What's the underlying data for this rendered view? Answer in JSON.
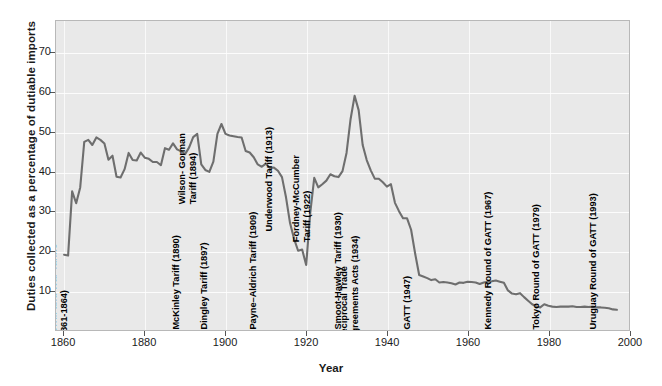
{
  "chart_data": {
    "type": "line",
    "title": "",
    "xlabel": "Year",
    "ylabel": "Duties collected as a percentage of dutiable imports",
    "xlim": [
      1858,
      2000
    ],
    "ylim": [
      0,
      78
    ],
    "xticks": [
      1860,
      1880,
      1900,
      1920,
      1940,
      1960,
      1980,
      2000
    ],
    "yticks": [
      10,
      20,
      30,
      40,
      50,
      60,
      70
    ],
    "grid": true,
    "legend": "none",
    "line_color": "#6e6e6e",
    "plot_background": "#e9e9e9",
    "series": [
      {
        "name": "Duties collected as a percentage of dutiable imports",
        "x": [
          1860,
          1861,
          1862,
          1863,
          1864,
          1865,
          1866,
          1867,
          1868,
          1869,
          1870,
          1871,
          1872,
          1873,
          1874,
          1875,
          1876,
          1877,
          1878,
          1879,
          1880,
          1881,
          1882,
          1883,
          1884,
          1885,
          1886,
          1887,
          1888,
          1889,
          1890,
          1891,
          1892,
          1893,
          1894,
          1895,
          1896,
          1897,
          1898,
          1899,
          1900,
          1901,
          1902,
          1903,
          1904,
          1905,
          1906,
          1907,
          1908,
          1909,
          1910,
          1911,
          1912,
          1913,
          1914,
          1915,
          1916,
          1917,
          1918,
          1919,
          1920,
          1921,
          1922,
          1923,
          1924,
          1925,
          1926,
          1927,
          1928,
          1929,
          1930,
          1931,
          1932,
          1933,
          1934,
          1935,
          1936,
          1937,
          1938,
          1939,
          1940,
          1941,
          1942,
          1943,
          1944,
          1945,
          1946,
          1947,
          1948,
          1949,
          1950,
          1951,
          1952,
          1953,
          1954,
          1955,
          1956,
          1957,
          1958,
          1959,
          1960,
          1961,
          1962,
          1963,
          1964,
          1965,
          1966,
          1967,
          1968,
          1969,
          1970,
          1971,
          1972,
          1973,
          1974,
          1975,
          1976,
          1977,
          1978,
          1979,
          1980,
          1981,
          1982,
          1983,
          1984,
          1985,
          1986,
          1987,
          1988,
          1989,
          1990,
          1991,
          1992,
          1993,
          1994,
          1995,
          1996,
          1997
        ],
        "y": [
          19.0,
          18.8,
          35.0,
          32.0,
          36.0,
          47.5,
          48.0,
          46.7,
          48.6,
          48.0,
          47.1,
          43.0,
          44.0,
          38.7,
          38.5,
          40.6,
          44.7,
          42.9,
          42.8,
          44.8,
          43.5,
          43.2,
          42.4,
          42.4,
          41.6,
          45.9,
          45.5,
          47.1,
          45.6,
          45.1,
          44.4,
          46.1,
          48.7,
          49.5,
          41.8,
          40.4,
          39.9,
          42.5,
          49.5,
          52.0,
          49.5,
          49.1,
          48.9,
          48.7,
          48.6,
          45.2,
          44.8,
          43.6,
          41.8,
          41.2,
          42.0,
          40.9,
          41.0,
          40.2,
          38.6,
          33.5,
          27.0,
          23.0,
          20.0,
          20.3,
          16.4,
          29.5,
          38.4,
          36.0,
          36.8,
          37.7,
          39.3,
          38.8,
          38.6,
          40.1,
          44.7,
          53.2,
          59.1,
          55.5,
          46.7,
          42.9,
          40.3,
          38.2,
          38.2,
          37.3,
          36.2,
          36.8,
          32.1,
          30.0,
          28.2,
          28.2,
          25.3,
          19.3,
          13.9,
          13.5,
          13.1,
          12.6,
          12.8,
          12.0,
          12.1,
          12.0,
          11.8,
          11.5,
          12.0,
          11.9,
          12.2,
          12.1,
          12.0,
          11.6,
          12.0,
          12.2,
          12.3,
          12.5,
          12.2,
          11.9,
          10.0,
          9.2,
          9.0,
          9.3,
          8.3,
          7.4,
          6.5,
          6.0,
          5.7,
          6.5,
          6.1,
          5.9,
          5.8,
          5.9,
          5.9,
          5.9,
          6.0,
          5.8,
          5.8,
          5.9,
          5.8,
          5.9,
          5.7,
          5.7,
          5.6,
          5.5,
          5.2,
          5.1
        ]
      }
    ],
    "annotations": [
      {
        "text": "Morrill and War Tariffs\n(1861-1864)",
        "year": 1862,
        "lines": 2
      },
      {
        "text": "McKinley Tariff (1890)",
        "year": 1890,
        "lines": 1
      },
      {
        "text": "Dingley Tariff (1897)",
        "year": 1897,
        "lines": 1
      },
      {
        "text": "Payne–Aldrich Tariff (1909)",
        "year": 1909,
        "lines": 1
      },
      {
        "text": "Wilson- Gorman\nTariff (1894)",
        "year": 1894,
        "lines": 2
      },
      {
        "text": "Underwood Tariff (1913)",
        "year": 1913,
        "lines": 1
      },
      {
        "text": "Fordney-McCumber\nTariff (1922)",
        "year": 1922,
        "lines": 2
      },
      {
        "text": "Smoot-Hawley Tariff (1930)",
        "year": 1930,
        "lines": 1
      },
      {
        "text": "Reciprocal Trade\nAgreements Acts (1934)",
        "year": 1934,
        "lines": 2
      },
      {
        "text": "GATT (1947)",
        "year": 1947,
        "lines": 1
      },
      {
        "text": "Kennedy Round of GATT (1967)",
        "year": 1967,
        "lines": 1
      },
      {
        "text": "Tokyo Round of GATT (1979)",
        "year": 1979,
        "lines": 1
      },
      {
        "text": "Uruguay Round of GATT (1993)",
        "year": 1993,
        "lines": 1
      }
    ]
  },
  "axes": {
    "x_title": "Year",
    "y_title": "Duties collected as a percentage of dutiable imports",
    "x_tick_labels": [
      "1860",
      "1880",
      "1900",
      "1920",
      "1940",
      "1960",
      "1980",
      "2000"
    ],
    "y_tick_labels": [
      "70",
      "60",
      "50",
      "40",
      "30",
      "20",
      "10"
    ]
  }
}
